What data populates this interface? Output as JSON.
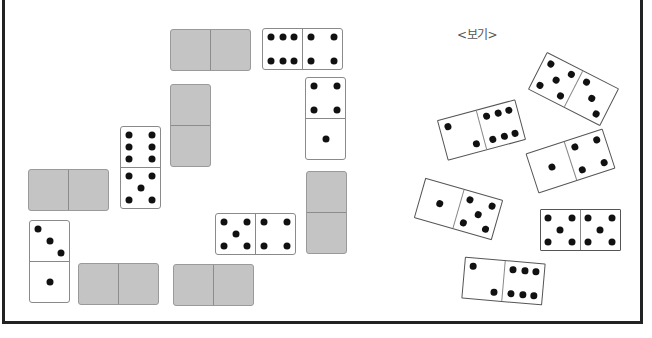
{
  "label": "<보기>",
  "colors": {
    "frame": "#222222",
    "gray_tile": "#c4c4c4",
    "pip": "#111111"
  },
  "board_dominoes": [
    {
      "id": "d1",
      "orientation": "h",
      "x": 170,
      "y": 29,
      "face": "down",
      "pips": null
    },
    {
      "id": "d2",
      "orientation": "h",
      "x": 262,
      "y": 28,
      "face": "up",
      "pips": [
        6,
        4
      ]
    },
    {
      "id": "d3",
      "orientation": "v",
      "x": 170,
      "y": 84,
      "face": "down",
      "pips": null
    },
    {
      "id": "d4",
      "orientation": "v",
      "x": 305,
      "y": 77,
      "face": "up",
      "pips": [
        4,
        1
      ]
    },
    {
      "id": "d5",
      "orientation": "v",
      "x": 120,
      "y": 126,
      "face": "up",
      "pips": [
        6,
        5
      ]
    },
    {
      "id": "d6",
      "orientation": "h",
      "x": 28,
      "y": 169,
      "face": "down",
      "pips": null
    },
    {
      "id": "d7",
      "orientation": "v",
      "x": 306,
      "y": 171,
      "face": "down",
      "pips": null
    },
    {
      "id": "d8",
      "orientation": "h",
      "x": 215,
      "y": 213,
      "face": "up",
      "pips": [
        5,
        4
      ]
    },
    {
      "id": "d9",
      "orientation": "v",
      "x": 29,
      "y": 220,
      "face": "up",
      "pips": [
        3,
        1
      ]
    },
    {
      "id": "d10",
      "orientation": "h",
      "x": 78,
      "y": 263,
      "face": "down",
      "pips": null
    },
    {
      "id": "d11",
      "orientation": "h",
      "x": 173,
      "y": 264,
      "face": "down",
      "pips": null
    }
  ],
  "example_dominoes": [
    {
      "id": "e1",
      "cx": 573,
      "cy": 89,
      "rotate": 27,
      "pips": [
        5,
        3
      ]
    },
    {
      "id": "e2",
      "cx": 481,
      "cy": 130,
      "rotate": -15,
      "pips": [
        2,
        6
      ]
    },
    {
      "id": "e3",
      "cx": 570,
      "cy": 161,
      "rotate": -18,
      "pips": [
        1,
        4
      ]
    },
    {
      "id": "e4",
      "cx": 458,
      "cy": 209,
      "rotate": 16,
      "pips": [
        1,
        5
      ]
    },
    {
      "id": "e5",
      "cx": 580,
      "cy": 230,
      "rotate": 0,
      "pips": [
        5,
        5
      ]
    },
    {
      "id": "e6",
      "cx": 503,
      "cy": 281,
      "rotate": 5,
      "pips": [
        2,
        6
      ]
    }
  ]
}
